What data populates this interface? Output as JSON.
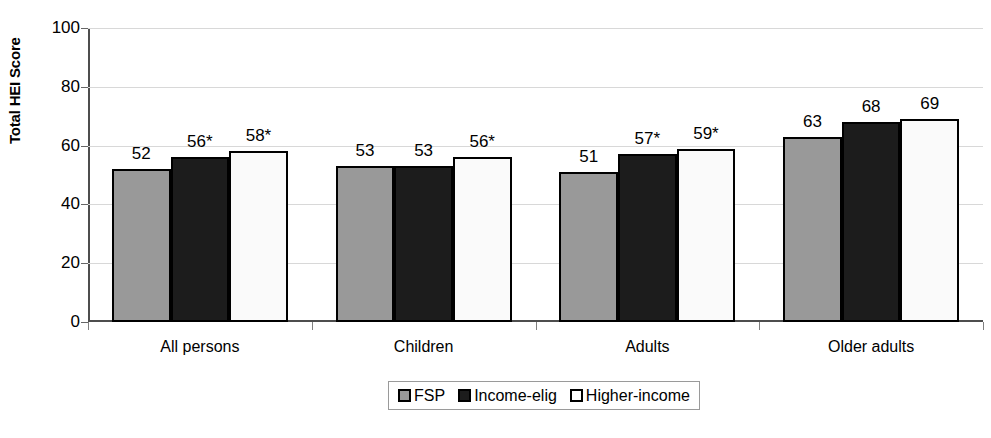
{
  "chart_data": {
    "type": "bar",
    "title": "",
    "xlabel": "",
    "ylabel": "Total HEI Score",
    "ylim": [
      0,
      100
    ],
    "yticks": [
      0,
      20,
      40,
      60,
      80,
      100
    ],
    "ytick_labels": [
      "0",
      "20",
      "40",
      "60",
      "80",
      "100"
    ],
    "grid": true,
    "legend_position": "bottom-center",
    "categories": [
      "All persons",
      "Children",
      "Adults",
      "Older adults"
    ],
    "series": [
      {
        "name": "FSP",
        "color": "#999999",
        "values": [
          52,
          53,
          51,
          63
        ],
        "labels": [
          "52",
          "53",
          "51",
          "63"
        ]
      },
      {
        "name": "Income-elig",
        "color": "#1c1c1c",
        "values": [
          56,
          53,
          57,
          68
        ],
        "labels": [
          "56*",
          "53",
          "57*",
          "68"
        ]
      },
      {
        "name": "Higher-income",
        "color": "#fafafa",
        "values": [
          58,
          56,
          59,
          69
        ],
        "labels": [
          "58*",
          "56*",
          "59*",
          "69"
        ]
      }
    ],
    "annotations": [
      "* indicates statistically significant difference"
    ]
  },
  "legend": {
    "items": [
      {
        "label": "FSP",
        "swatch": "fsp"
      },
      {
        "label": "Income-elig",
        "swatch": "elig"
      },
      {
        "label": "Higher-income",
        "swatch": "higher"
      }
    ]
  },
  "colors": {
    "fsp": "#999999",
    "income_elig": "#1c1c1c",
    "higher_income": "#fafafa",
    "axis": "#4d4d4d",
    "grid": "#d8d8d8"
  }
}
